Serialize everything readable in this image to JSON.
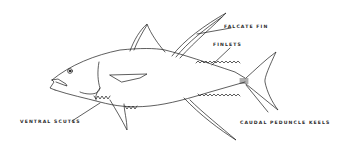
{
  "diagram": {
    "labels": {
      "falcate_fin": "FALCATE FIN",
      "finlets": "FINLETS",
      "ventral_scutes": "VENTRAL  SCUTES",
      "caudal_peduncle_keels": "CAUDAL PEDUNCLE KEELS"
    },
    "colors": {
      "line": "#1a1a1a",
      "background": "#ffffff"
    }
  }
}
